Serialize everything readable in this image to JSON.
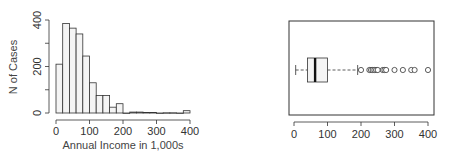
{
  "chart_data": [
    {
      "type": "bar",
      "subtype": "histogram",
      "title": "",
      "xlabel": "Annual Income in 1,000s",
      "ylabel": "N of Cases",
      "bin_width": 20,
      "bin_edges": [
        0,
        20,
        40,
        60,
        80,
        100,
        120,
        140,
        160,
        180,
        200,
        220,
        240,
        260,
        280,
        300,
        320,
        340,
        360,
        380,
        400
      ],
      "values": [
        210,
        385,
        365,
        340,
        245,
        130,
        75,
        75,
        25,
        40,
        0,
        4,
        4,
        2,
        2,
        0,
        1,
        1,
        0,
        10
      ],
      "xticks": [
        "0",
        "100",
        "200",
        "300",
        "400"
      ],
      "yticks": [
        "0",
        "200",
        "400"
      ],
      "xlim": [
        0,
        400
      ],
      "ylim": [
        0,
        400
      ],
      "grid": false,
      "bar_fill": "#f4f4f4",
      "bar_stroke": "#333333"
    },
    {
      "type": "boxplot",
      "orientation": "horizontal",
      "title": "",
      "xlabel": "",
      "ylabel": "",
      "whisker_low": 5,
      "q1": 40,
      "median": 63,
      "q3": 100,
      "whisker_high": 190,
      "outliers": [
        200,
        225,
        230,
        235,
        240,
        245,
        250,
        265,
        270,
        275,
        300,
        325,
        350,
        360,
        400
      ],
      "xticks": [
        "0",
        "100",
        "200",
        "300",
        "400"
      ],
      "xlim": [
        0,
        400
      ],
      "box_fill": "#f4f4f4",
      "stroke": "#333333"
    }
  ]
}
